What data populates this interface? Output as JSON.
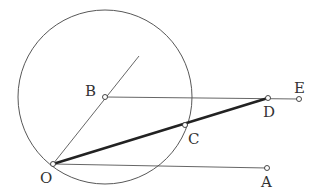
{
  "diagram": {
    "type": "geometry",
    "circle": {
      "center": "B",
      "cx": 105,
      "cy": 97,
      "r": 87
    },
    "points": {
      "O": {
        "x": 53,
        "y": 164,
        "label": "O",
        "lx": 40,
        "ly": 182
      },
      "A": {
        "x": 267,
        "y": 168,
        "label": "A",
        "lx": 261,
        "ly": 187
      },
      "B": {
        "x": 105,
        "y": 97,
        "label": "B",
        "lx": 86,
        "ly": 95
      },
      "C": {
        "x": 185,
        "y": 125,
        "label": "C",
        "lx": 188,
        "ly": 143
      },
      "D": {
        "x": 268,
        "y": 98,
        "label": "D",
        "lx": 263,
        "ly": 116
      },
      "E": {
        "x": 299,
        "y": 99,
        "label": "E",
        "lx": 294,
        "ly": 93
      }
    },
    "segments": [
      {
        "from": "O",
        "to": "A",
        "weight": "thin"
      },
      {
        "from": "B",
        "to": "E",
        "weight": "thin"
      },
      {
        "from": "O",
        "to": "D",
        "weight": "thick"
      },
      {
        "from": "O",
        "to": "ray-end",
        "weight": "thin"
      }
    ],
    "labels": [
      "O",
      "A",
      "B",
      "C",
      "D",
      "E"
    ]
  }
}
